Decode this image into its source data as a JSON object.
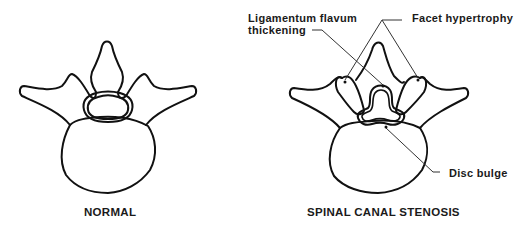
{
  "figures": [
    {
      "caption": "NORMAL"
    },
    {
      "caption": "SPINAL CANAL STENOSIS"
    }
  ],
  "annotations": {
    "ligamentum_line1": "Ligamentum  flavum",
    "ligamentum_line2": "thickening",
    "facet": "Facet hypertrophy",
    "disc": "Disc bulge"
  },
  "colors": {
    "stroke": "#111111",
    "leader": "#333333",
    "background": "#ffffff"
  }
}
